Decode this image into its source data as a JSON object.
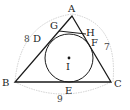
{
  "diagram": {
    "type": "geometry",
    "vertices": {
      "A": {
        "label": "A",
        "x": 72,
        "y": 16
      },
      "B": {
        "label": "B",
        "x": 15,
        "y": 82
      },
      "C": {
        "label": "C",
        "x": 111,
        "y": 82
      }
    },
    "incircle": {
      "center_label": "I",
      "cx": 69,
      "cy": 58,
      "r": 24
    },
    "tangent_points": {
      "D": "D",
      "E": "E",
      "F": "F"
    },
    "tangent_segment": {
      "G": "G",
      "H": "H"
    },
    "side_lengths": {
      "AB": "8",
      "AC": "7",
      "BC": "9"
    },
    "colors": {
      "lines": "#1a1a1a",
      "arcs": "#bdbdbd",
      "labels": "#222222"
    }
  }
}
